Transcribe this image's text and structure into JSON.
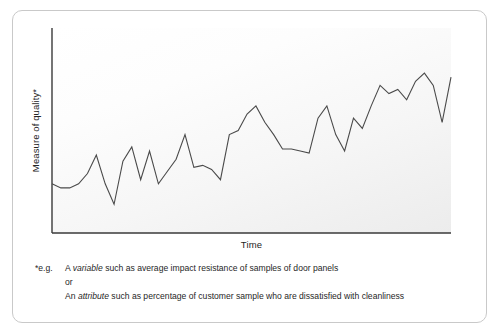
{
  "figure": {
    "y_axis_title": "Measure of quality*",
    "x_axis_title": "Time"
  },
  "footnote": {
    "marker": "*e.g.",
    "line1_pre": "A ",
    "line1_em": "variable",
    "line1_post": " such as average impact resistance of samples of door panels",
    "line2": "or",
    "line3_pre": "An ",
    "line3_em": "attribute",
    "line3_post": " such as percentage of customer sample who are dissatisfied with cleanliness"
  },
  "colors": {
    "line": "#4a4a4a",
    "axis": "#3a3a3a",
    "card_border": "#c9c9c9",
    "panel_light": "#ffffff",
    "panel_dark": "#ececec",
    "text": "#222222"
  },
  "chart_data": {
    "type": "line",
    "title": "",
    "subtitle": "",
    "xlabel": "Time",
    "ylabel": "Measure of quality*",
    "grid": false,
    "legend": null,
    "annotations": [],
    "xlim": [
      0,
      45
    ],
    "ylim": [
      0,
      100
    ],
    "x_tick_labels": [],
    "y_tick_labels": [],
    "axis_style": "open-left-bottom-spines-only",
    "series": [
      {
        "name": "Measure of quality",
        "x": [
          0,
          1,
          2,
          3,
          4,
          5,
          6,
          7,
          8,
          9,
          10,
          11,
          12,
          13,
          14,
          15,
          16,
          17,
          18,
          19,
          20,
          21,
          22,
          23,
          24,
          25,
          26,
          27,
          28,
          29,
          30,
          31,
          32,
          33,
          34,
          35,
          36,
          37,
          38,
          39,
          40,
          41,
          42,
          43,
          44,
          45
        ],
        "values": [
          24,
          22,
          22,
          24,
          29,
          38,
          24,
          14,
          35,
          42,
          26,
          40,
          24,
          30,
          36,
          48,
          32,
          33,
          31,
          26,
          48,
          50,
          58,
          62,
          54,
          48,
          41,
          41,
          40,
          39,
          56,
          62,
          48,
          40,
          56,
          51,
          62,
          72,
          68,
          70,
          65,
          74,
          78,
          72,
          54,
          76
        ]
      }
    ]
  }
}
